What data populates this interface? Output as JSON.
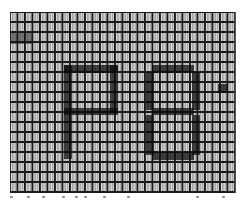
{
  "image": {
    "description": "Macro photograph of a grayscale LCD pixel grid displaying characters",
    "displayed_text": "P8",
    "partial_glyph": "'",
    "grid": {
      "pitch_x_px": 7.5,
      "pitch_y_px": 10,
      "line_color": "#1a1a1a",
      "subpixel_colors": [
        "#dcdcdc",
        "#a8a8a8",
        "#e4e4e4",
        "#9a9a9a"
      ]
    },
    "glyph_color": "#0a0a0a"
  }
}
